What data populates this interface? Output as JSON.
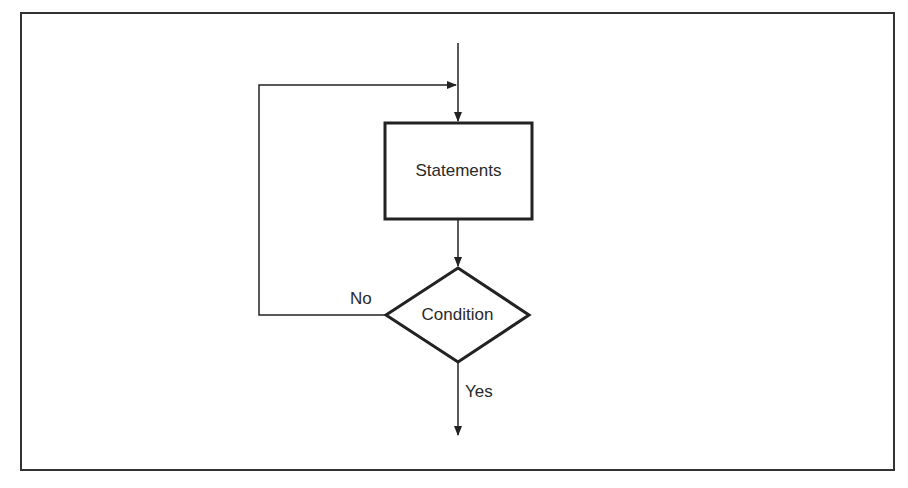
{
  "diagram": {
    "type": "flowchart",
    "nodes": [
      {
        "id": "statements",
        "shape": "rectangle",
        "label": "Statements"
      },
      {
        "id": "condition",
        "shape": "diamond",
        "label": "Condition"
      }
    ],
    "edges": [
      {
        "from": "entry",
        "to": "statements",
        "label": ""
      },
      {
        "from": "statements",
        "to": "condition",
        "label": ""
      },
      {
        "from": "condition",
        "to": "statements",
        "label": "No"
      },
      {
        "from": "condition",
        "to": "exit",
        "label": "Yes"
      }
    ],
    "colors": {
      "stroke": "#222222",
      "background": "#ffffff",
      "text": "#2a2a2a"
    }
  }
}
